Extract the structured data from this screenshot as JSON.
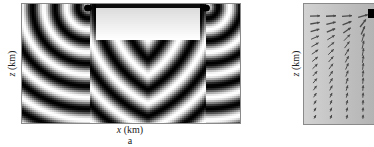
{
  "figure": {
    "panels": [
      {
        "id": "a",
        "caption": "a",
        "xlabel_var": "x",
        "xlabel_unit": " (km)",
        "ylabel_var": "z",
        "ylabel_unit": " (km)",
        "content": "wavefield-interference-pattern",
        "sources": 2,
        "colormap": "grayscale"
      },
      {
        "id": "b",
        "ylabel_var": "z",
        "ylabel_unit": " (km)",
        "content": "vector-field-arrows",
        "arrow_columns": 4,
        "arrow_rows": 15,
        "sources": 1
      }
    ]
  },
  "colors": {
    "frame": "#8a8a8a",
    "wave_dark": "#000000",
    "wave_light": "#ffffff",
    "vector_bg": "#c4c4c4",
    "arrow": "#4a4a4a"
  }
}
